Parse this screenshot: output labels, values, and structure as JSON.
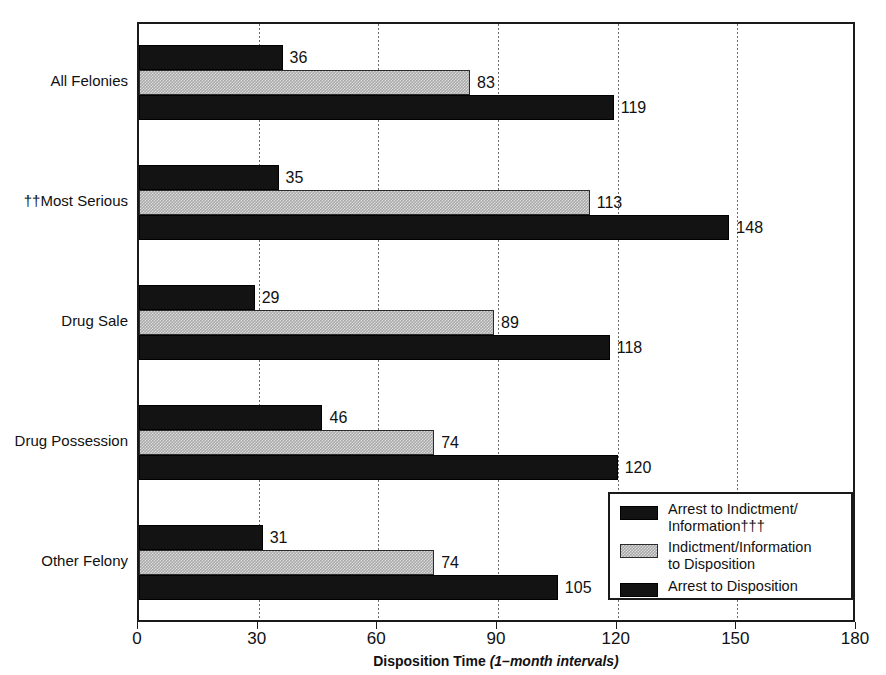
{
  "chart_data": {
    "type": "bar",
    "orientation": "horizontal",
    "title": "",
    "xlabel_bold": "Disposition Time",
    "xlabel_italic": "(1–month intervals)",
    "ylabel": "",
    "xlim": [
      0,
      180
    ],
    "xticks": [
      0,
      30,
      60,
      90,
      120,
      150,
      180
    ],
    "xtick_labels": [
      "0",
      "30",
      "60",
      "90",
      "120",
      "150",
      "180"
    ],
    "grid": "vertical-dotted",
    "legend_position": "lower-right-inside",
    "categories": [
      "All Felonies",
      "††Most Serious",
      "Drug Sale",
      "Drug Possession",
      "Other Felony"
    ],
    "series": [
      {
        "name": "Arrest to Indictment/Information†††",
        "style": "dark",
        "values": [
          36,
          35,
          29,
          46,
          31
        ]
      },
      {
        "name": "Indictment/Information to Disposition",
        "style": "gray",
        "values": [
          83,
          113,
          89,
          74,
          74
        ]
      },
      {
        "name": "Arrest  to Disposition",
        "style": "dark",
        "values": [
          119,
          148,
          118,
          120,
          105
        ]
      }
    ],
    "data_labels": [
      [
        "36",
        "83",
        "119"
      ],
      [
        "35",
        "113",
        "148"
      ],
      [
        "29",
        "89",
        "118"
      ],
      [
        "46",
        "74",
        "120"
      ],
      [
        "31",
        "74",
        "105"
      ]
    ]
  },
  "legend": {
    "items": [
      {
        "label": "Arrest to Indictment/\nInformation†††",
        "style": "dark"
      },
      {
        "label": "Indictment/Information\nto Disposition",
        "style": "gray"
      },
      {
        "label": "Arrest  to Disposition",
        "style": "dark"
      }
    ]
  },
  "colors": {
    "dark_bar": "#131313",
    "gray_bar": "#a8a8a8",
    "axis": "#1a1a1a",
    "text": "#111111",
    "background": "#ffffff"
  }
}
